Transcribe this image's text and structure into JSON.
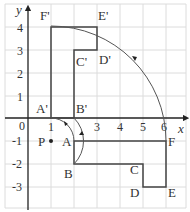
{
  "figure": {
    "axes": {
      "x_label": "x",
      "y_label": "y",
      "x_ticks": [
        "1",
        "2",
        "3",
        "4",
        "5",
        "6"
      ],
      "y_ticks": [
        "4",
        "3",
        "2",
        "1",
        "-1",
        "-2",
        "-3"
      ],
      "origin_label": "0"
    },
    "point_center": {
      "label": "P",
      "x": 1,
      "y": -1
    },
    "shape_original": {
      "vertices": [
        {
          "label": "A",
          "x": 2,
          "y": -1
        },
        {
          "label": "B",
          "x": 2,
          "y": -2
        },
        {
          "label": "C",
          "x": 5,
          "y": -2
        },
        {
          "label": "D",
          "x": 5,
          "y": -3
        },
        {
          "label": "E",
          "x": 6,
          "y": -3
        },
        {
          "label": "F",
          "x": 6,
          "y": -1
        }
      ]
    },
    "shape_image": {
      "vertices": [
        {
          "label": "A'",
          "x": 1,
          "y": 0
        },
        {
          "label": "B'",
          "x": 2,
          "y": 0
        },
        {
          "label": "C'",
          "x": 2,
          "y": 3
        },
        {
          "label": "D'",
          "x": 3,
          "y": 3
        },
        {
          "label": "E'",
          "x": 3,
          "y": 4
        },
        {
          "label": "F'",
          "x": 1,
          "y": 4
        }
      ]
    },
    "rotation_arcs": [
      "A to A'",
      "B to B'",
      "F to F'"
    ],
    "colors": {
      "grid": "#d9d9d9",
      "shape": "#444444",
      "axis": "#222222",
      "arc": "#555555"
    }
  }
}
